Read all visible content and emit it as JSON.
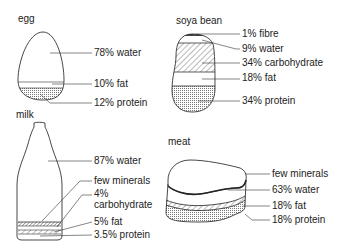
{
  "diagram": {
    "type": "food composition illustration",
    "panels": [
      {
        "id": "egg",
        "title": "egg",
        "components": [
          {
            "label": "78% water",
            "percent": 78,
            "substance": "water"
          },
          {
            "label": "10% fat",
            "percent": 10,
            "substance": "fat"
          },
          {
            "label": "12% protein",
            "percent": 12,
            "substance": "protein"
          }
        ]
      },
      {
        "id": "soya-bean",
        "title": "soya bean",
        "components": [
          {
            "label": "1% fibre",
            "percent": 1,
            "substance": "fibre"
          },
          {
            "label": "9% water",
            "percent": 9,
            "substance": "water"
          },
          {
            "label": "34% carbohydrate",
            "percent": 34,
            "substance": "carbohydrate"
          },
          {
            "label": "18% fat",
            "percent": 18,
            "substance": "fat"
          },
          {
            "label": "34% protein",
            "percent": 34,
            "substance": "protein"
          }
        ]
      },
      {
        "id": "milk",
        "title": "milk",
        "components": [
          {
            "label": "87% water",
            "percent": 87,
            "substance": "water"
          },
          {
            "label": "few minerals",
            "percent": null,
            "substance": "minerals"
          },
          {
            "label_line1": "4%",
            "label_line2": "carbohydrate",
            "percent": 4,
            "substance": "carbohydrate"
          },
          {
            "label": "5% fat",
            "percent": 5,
            "substance": "fat"
          },
          {
            "label": "3.5% protein",
            "percent": 3.5,
            "substance": "protein"
          }
        ]
      },
      {
        "id": "meat",
        "title": "meat",
        "components": [
          {
            "label": "few minerals",
            "percent": null,
            "substance": "minerals"
          },
          {
            "label": "63% water",
            "percent": 63,
            "substance": "water"
          },
          {
            "label": "18% fat",
            "percent": 18,
            "substance": "fat"
          },
          {
            "label": "18% protein",
            "percent": 18,
            "substance": "protein"
          }
        ]
      }
    ]
  }
}
